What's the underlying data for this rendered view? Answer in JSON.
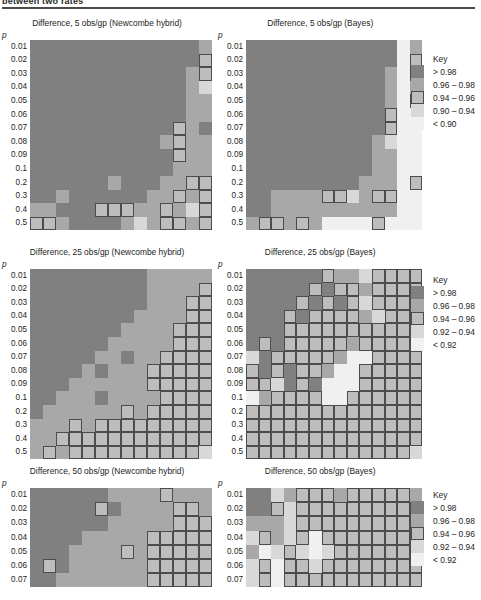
{
  "running_head": "between two rates",
  "palette": {
    "c1": "#808080",
    "c2": "#a8a8a8",
    "c3": "#bdbdbd",
    "c4": "#d8d8d8",
    "c5": "#f0f0f0",
    "border": "#4c4c4c",
    "gridline": "#8e8e8e"
  },
  "y_axis_label": "p",
  "y_ticks_14": [
    "0.01",
    "0.02",
    "0.03",
    "0.04",
    "0.05",
    "0.06",
    "0.07",
    "0.08",
    "0.09",
    "0.1",
    "0.2",
    "0.3",
    "0.4",
    "0.5"
  ],
  "y_ticks_7": [
    "0.01",
    "0.02",
    "0.03",
    "0.04",
    "0.05",
    "0.06",
    "0.07"
  ],
  "keys": {
    "key_090": {
      "title": "Key",
      "entries": [
        {
          "label": "> 0.98",
          "color": "#808080",
          "bordered": false
        },
        {
          "label": "0.96 – 0.98",
          "color": "#a8a8a8",
          "bordered": false
        },
        {
          "label": "0.94 – 0.96",
          "color": "#bdbdbd",
          "bordered": true
        },
        {
          "label": "0.90 – 0.94",
          "color": "#d8d8d8",
          "bordered": false
        },
        {
          "label": "< 0.90",
          "color": "#f0f0f0",
          "bordered": false
        }
      ]
    },
    "key_092": {
      "title": "Key",
      "entries": [
        {
          "label": "> 0.98",
          "color": "#808080",
          "bordered": false
        },
        {
          "label": "0.96 – 0.98",
          "color": "#a8a8a8",
          "bordered": false
        },
        {
          "label": "0.94 – 0.96",
          "color": "#bdbdbd",
          "bordered": true
        },
        {
          "label": "0.92 – 0.94",
          "color": "#d8d8d8",
          "bordered": false
        },
        {
          "label": "< 0.92",
          "color": "#f0f0f0",
          "bordered": false
        }
      ]
    }
  },
  "chart_data": [
    {
      "id": "c1",
      "type": "heatmap",
      "title": "Difference, 5 obs/gp (Newcombe hybrid)",
      "ylabel": "p",
      "rows": 14,
      "cols": 14,
      "ytick_labels": [
        "0.01",
        "0.02",
        "0.03",
        "0.04",
        "0.05",
        "0.06",
        "0.07",
        "0.08",
        "0.09",
        "0.1",
        "0.2",
        "0.3",
        "0.4",
        "0.5"
      ],
      "legend": "key_090",
      "values": [
        [
          1,
          1,
          1,
          1,
          1,
          1,
          1,
          1,
          1,
          1,
          1,
          1,
          1,
          2
        ],
        [
          1,
          1,
          1,
          1,
          1,
          1,
          1,
          1,
          1,
          1,
          1,
          1,
          1,
          3
        ],
        [
          1,
          1,
          1,
          1,
          1,
          1,
          1,
          1,
          1,
          1,
          1,
          1,
          2,
          3
        ],
        [
          1,
          1,
          1,
          1,
          1,
          1,
          1,
          1,
          1,
          1,
          1,
          1,
          2,
          4
        ],
        [
          1,
          1,
          1,
          1,
          1,
          1,
          1,
          1,
          1,
          1,
          1,
          1,
          2,
          2
        ],
        [
          1,
          1,
          1,
          1,
          1,
          1,
          1,
          1,
          1,
          1,
          1,
          1,
          2,
          2
        ],
        [
          1,
          1,
          1,
          1,
          1,
          1,
          1,
          1,
          1,
          1,
          1,
          3,
          2,
          1
        ],
        [
          1,
          1,
          1,
          1,
          1,
          1,
          1,
          1,
          1,
          1,
          2,
          3,
          2,
          2
        ],
        [
          1,
          1,
          1,
          1,
          1,
          1,
          1,
          1,
          1,
          1,
          1,
          3,
          2,
          2
        ],
        [
          1,
          1,
          1,
          1,
          1,
          1,
          1,
          1,
          1,
          1,
          1,
          2,
          2,
          2
        ],
        [
          1,
          1,
          1,
          1,
          1,
          1,
          2,
          1,
          1,
          1,
          2,
          2,
          3,
          3
        ],
        [
          1,
          1,
          2,
          1,
          1,
          1,
          1,
          1,
          1,
          2,
          2,
          3,
          2,
          3
        ],
        [
          2,
          2,
          1,
          1,
          1,
          3,
          3,
          3,
          2,
          2,
          3,
          2,
          4,
          3
        ],
        [
          3,
          3,
          2,
          1,
          1,
          1,
          1,
          2,
          4,
          2,
          3,
          3,
          2,
          3
        ]
      ]
    },
    {
      "id": "c2",
      "type": "heatmap",
      "title": "Difference, 5 obs/gp (Bayes)",
      "ylabel": "p",
      "rows": 14,
      "cols": 14,
      "ytick_labels": [
        "0.01",
        "0.02",
        "0.03",
        "0.04",
        "0.05",
        "0.06",
        "0.07",
        "0.08",
        "0.09",
        "0.1",
        "0.2",
        "0.3",
        "0.4",
        "0.5"
      ],
      "legend": "key_090",
      "values": [
        [
          1,
          1,
          1,
          1,
          1,
          1,
          1,
          1,
          1,
          1,
          1,
          1,
          5,
          2
        ],
        [
          1,
          1,
          1,
          1,
          1,
          1,
          1,
          1,
          1,
          1,
          1,
          1,
          5,
          3
        ],
        [
          1,
          1,
          1,
          1,
          1,
          1,
          1,
          1,
          1,
          1,
          1,
          2,
          5,
          3
        ],
        [
          1,
          1,
          1,
          1,
          1,
          1,
          1,
          1,
          1,
          1,
          1,
          2,
          5,
          2
        ],
        [
          1,
          1,
          1,
          1,
          1,
          1,
          1,
          1,
          1,
          1,
          1,
          2,
          5,
          3
        ],
        [
          1,
          1,
          1,
          1,
          1,
          1,
          1,
          1,
          1,
          1,
          1,
          3,
          5,
          5
        ],
        [
          1,
          1,
          1,
          1,
          1,
          1,
          1,
          1,
          1,
          1,
          1,
          3,
          5,
          5
        ],
        [
          1,
          1,
          1,
          1,
          1,
          1,
          1,
          1,
          1,
          1,
          2,
          4,
          5,
          5
        ],
        [
          1,
          1,
          1,
          1,
          1,
          1,
          1,
          1,
          1,
          1,
          2,
          2,
          5,
          5
        ],
        [
          1,
          1,
          1,
          1,
          1,
          1,
          1,
          1,
          1,
          1,
          2,
          2,
          5,
          5
        ],
        [
          1,
          1,
          1,
          1,
          1,
          1,
          1,
          1,
          1,
          2,
          2,
          2,
          5,
          3
        ],
        [
          1,
          1,
          2,
          2,
          2,
          2,
          3,
          3,
          4,
          2,
          3,
          3,
          5,
          5
        ],
        [
          1,
          1,
          2,
          2,
          2,
          2,
          2,
          2,
          2,
          2,
          2,
          2,
          5,
          5
        ],
        [
          2,
          3,
          3,
          2,
          3,
          2,
          5,
          5,
          5,
          5,
          3,
          5,
          5,
          5
        ]
      ]
    },
    {
      "id": "c3",
      "type": "heatmap",
      "title": "Difference, 25 obs/gp (Newcombe hybrid)",
      "ylabel": "p",
      "rows": 14,
      "cols": 14,
      "ytick_labels": [
        "0.01",
        "0.02",
        "0.03",
        "0.04",
        "0.05",
        "0.06",
        "0.07",
        "0.08",
        "0.09",
        "0.1",
        "0.2",
        "0.3",
        "0.4",
        "0.5"
      ],
      "legend": "key_092",
      "values": [
        [
          1,
          1,
          1,
          1,
          1,
          1,
          1,
          1,
          1,
          2,
          2,
          2,
          2,
          2
        ],
        [
          1,
          1,
          1,
          1,
          1,
          1,
          1,
          1,
          1,
          2,
          2,
          2,
          2,
          3
        ],
        [
          1,
          1,
          1,
          1,
          1,
          1,
          1,
          1,
          1,
          2,
          2,
          2,
          3,
          3
        ],
        [
          1,
          1,
          1,
          1,
          1,
          1,
          1,
          1,
          2,
          2,
          2,
          2,
          3,
          3
        ],
        [
          1,
          1,
          1,
          1,
          1,
          1,
          1,
          2,
          2,
          2,
          2,
          3,
          3,
          3
        ],
        [
          1,
          1,
          1,
          1,
          1,
          1,
          2,
          2,
          2,
          2,
          2,
          3,
          3,
          3
        ],
        [
          1,
          1,
          1,
          1,
          1,
          2,
          2,
          1,
          2,
          2,
          3,
          3,
          3,
          3
        ],
        [
          1,
          1,
          1,
          1,
          2,
          1,
          2,
          2,
          2,
          3,
          3,
          3,
          3,
          3
        ],
        [
          1,
          1,
          1,
          2,
          2,
          2,
          2,
          2,
          2,
          3,
          3,
          3,
          3,
          3
        ],
        [
          1,
          1,
          2,
          2,
          2,
          1,
          2,
          2,
          2,
          2,
          3,
          3,
          3,
          3
        ],
        [
          1,
          2,
          2,
          2,
          2,
          2,
          2,
          3,
          2,
          3,
          3,
          3,
          3,
          3
        ],
        [
          2,
          2,
          2,
          3,
          2,
          3,
          3,
          3,
          3,
          3,
          3,
          3,
          3,
          3
        ],
        [
          2,
          2,
          3,
          3,
          3,
          3,
          3,
          3,
          3,
          3,
          3,
          3,
          3,
          3
        ],
        [
          2,
          3,
          2,
          3,
          3,
          3,
          3,
          3,
          3,
          3,
          3,
          3,
          3,
          4
        ]
      ]
    },
    {
      "id": "c4",
      "type": "heatmap",
      "title": "Difference, 25 obs/gp (Bayes)",
      "ylabel": "p",
      "rows": 14,
      "cols": 14,
      "ytick_labels": [
        "0.01",
        "0.02",
        "0.03",
        "0.04",
        "0.05",
        "0.06",
        "0.07",
        "0.08",
        "0.09",
        "0.1",
        "0.2",
        "0.3",
        "0.4",
        "0.5"
      ],
      "legend": "key_092",
      "values": [
        [
          1,
          1,
          1,
          1,
          1,
          1,
          3,
          2,
          2,
          4,
          3,
          3,
          3,
          3
        ],
        [
          1,
          1,
          1,
          1,
          1,
          3,
          1,
          3,
          3,
          2,
          3,
          3,
          3,
          3
        ],
        [
          1,
          1,
          1,
          1,
          3,
          1,
          3,
          1,
          3,
          4,
          3,
          3,
          3,
          3
        ],
        [
          1,
          1,
          1,
          3,
          1,
          3,
          3,
          3,
          3,
          2,
          4,
          3,
          3,
          3
        ],
        [
          1,
          1,
          1,
          3,
          3,
          3,
          3,
          3,
          3,
          3,
          3,
          3,
          3,
          3
        ],
        [
          1,
          3,
          1,
          3,
          3,
          3,
          3,
          3,
          2,
          3,
          3,
          3,
          3,
          3
        ],
        [
          4,
          1,
          3,
          3,
          3,
          3,
          3,
          2,
          5,
          5,
          3,
          3,
          3,
          3
        ],
        [
          3,
          1,
          3,
          1,
          3,
          3,
          2,
          5,
          5,
          3,
          3,
          3,
          3,
          3
        ],
        [
          3,
          3,
          4,
          1,
          3,
          1,
          5,
          5,
          5,
          3,
          3,
          3,
          3,
          3
        ],
        [
          5,
          2,
          3,
          3,
          3,
          3,
          5,
          5,
          3,
          3,
          3,
          3,
          3,
          3
        ],
        [
          3,
          3,
          3,
          3,
          3,
          3,
          3,
          3,
          3,
          3,
          3,
          3,
          3,
          3
        ],
        [
          3,
          3,
          3,
          3,
          3,
          3,
          3,
          3,
          3,
          3,
          3,
          3,
          3,
          3
        ],
        [
          3,
          3,
          3,
          3,
          3,
          3,
          3,
          3,
          3,
          3,
          3,
          3,
          3,
          3
        ],
        [
          3,
          3,
          3,
          3,
          3,
          3,
          3,
          3,
          3,
          3,
          3,
          3,
          3,
          4
        ]
      ]
    },
    {
      "id": "c5",
      "type": "heatmap",
      "title": "Difference, 50 obs/gp (Newcombe hybrid)",
      "ylabel": "p",
      "rows": 7,
      "cols": 14,
      "ytick_labels": [
        "0.01",
        "0.02",
        "0.03",
        "0.04",
        "0.05",
        "0.06",
        "0.07"
      ],
      "legend": "key_092",
      "values": [
        [
          1,
          1,
          1,
          1,
          1,
          1,
          2,
          2,
          2,
          2,
          3,
          2,
          2,
          2
        ],
        [
          1,
          1,
          1,
          1,
          1,
          3,
          1,
          2,
          2,
          2,
          2,
          3,
          3,
          2
        ],
        [
          1,
          1,
          1,
          1,
          1,
          1,
          2,
          2,
          2,
          2,
          2,
          3,
          3,
          3
        ],
        [
          1,
          1,
          1,
          1,
          2,
          2,
          2,
          2,
          2,
          3,
          3,
          3,
          3,
          3
        ],
        [
          1,
          1,
          1,
          2,
          2,
          2,
          2,
          3,
          2,
          3,
          3,
          3,
          3,
          3
        ],
        [
          1,
          3,
          1,
          2,
          2,
          2,
          2,
          2,
          2,
          3,
          3,
          3,
          3,
          3
        ],
        [
          1,
          1,
          2,
          2,
          2,
          2,
          2,
          2,
          2,
          3,
          3,
          3,
          3,
          3
        ]
      ]
    },
    {
      "id": "c6",
      "type": "heatmap",
      "title": "Difference, 50 obs/gp (Bayes)",
      "ylabel": "p",
      "rows": 7,
      "cols": 14,
      "ytick_labels": [
        "0.01",
        "0.02",
        "0.03",
        "0.04",
        "0.05",
        "0.06",
        "0.07"
      ],
      "legend": "key_092",
      "values": [
        [
          1,
          1,
          4,
          2,
          3,
          3,
          3,
          2,
          3,
          3,
          3,
          3,
          3,
          2
        ],
        [
          1,
          1,
          3,
          4,
          3,
          3,
          3,
          3,
          3,
          3,
          3,
          3,
          3,
          3
        ],
        [
          2,
          2,
          2,
          4,
          3,
          3,
          3,
          3,
          3,
          3,
          3,
          3,
          3,
          3
        ],
        [
          4,
          3,
          2,
          4,
          3,
          5,
          3,
          3,
          3,
          3,
          3,
          3,
          3,
          3
        ],
        [
          2,
          5,
          4,
          3,
          4,
          5,
          4,
          3,
          3,
          3,
          3,
          3,
          3,
          3
        ],
        [
          4,
          3,
          5,
          3,
          3,
          4,
          3,
          3,
          3,
          3,
          3,
          3,
          3,
          3
        ],
        [
          4,
          3,
          5,
          3,
          3,
          3,
          3,
          3,
          3,
          3,
          3,
          3,
          3,
          3
        ]
      ]
    }
  ],
  "layout": {
    "blocks": [
      {
        "chart": 0,
        "left": 2,
        "top": 18,
        "cellW": 13.0,
        "cellH": 13.6,
        "key": null,
        "keyLeft": 0,
        "keyTop": 0
      },
      {
        "chart": 1,
        "left": 218,
        "top": 18,
        "cellW": 12.6,
        "cellH": 13.6,
        "key": "key_090",
        "keyLeft": 411,
        "keyTop": 56
      },
      {
        "chart": 2,
        "left": 2,
        "top": 247,
        "cellW": 13.0,
        "cellH": 13.6,
        "key": null,
        "keyLeft": 0,
        "keyTop": 0
      },
      {
        "chart": 3,
        "left": 218,
        "top": 247,
        "cellW": 12.6,
        "cellH": 13.6,
        "key": "key_092",
        "keyLeft": 411,
        "keyTop": 277
      },
      {
        "chart": 4,
        "left": 2,
        "top": 466,
        "cellW": 13.0,
        "cellH": 14.2,
        "key": null,
        "keyLeft": 0,
        "keyTop": 0
      },
      {
        "chart": 5,
        "left": 218,
        "top": 466,
        "cellW": 12.6,
        "cellH": 14.2,
        "key": "key_092",
        "keyLeft": 411,
        "keyTop": 492
      }
    ]
  }
}
